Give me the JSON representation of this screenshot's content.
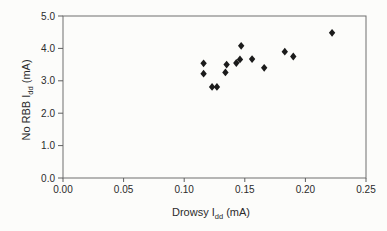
{
  "chart_data": {
    "type": "scatter",
    "title": "",
    "xlabel": {
      "pre": "Drowsy I",
      "sub": "dd",
      "post": " (mA)"
    },
    "ylabel": {
      "pre": "No RBB I",
      "sub": "dd",
      "post": " (mA)"
    },
    "xlim": [
      0,
      0.25
    ],
    "ylim": [
      0,
      5
    ],
    "x_ticks": [
      "0.00",
      "0.05",
      "0.10",
      "0.15",
      "0.20",
      "0.25"
    ],
    "y_ticks": [
      "0.0",
      "1.0",
      "2.0",
      "3.0",
      "4.0",
      "5.0"
    ],
    "grid": false,
    "legend": "none",
    "marker": "diamond",
    "colors": {
      "marker": "#1b1b1b",
      "axis": "#6e6e6e",
      "text": "#2b2b2b",
      "background": "#fcfcfa"
    },
    "points": [
      {
        "x": 0.116,
        "y": 3.54
      },
      {
        "x": 0.116,
        "y": 3.22
      },
      {
        "x": 0.123,
        "y": 2.81
      },
      {
        "x": 0.127,
        "y": 2.81
      },
      {
        "x": 0.134,
        "y": 3.26
      },
      {
        "x": 0.135,
        "y": 3.5
      },
      {
        "x": 0.143,
        "y": 3.55
      },
      {
        "x": 0.146,
        "y": 3.66
      },
      {
        "x": 0.147,
        "y": 4.08
      },
      {
        "x": 0.156,
        "y": 3.67
      },
      {
        "x": 0.166,
        "y": 3.4
      },
      {
        "x": 0.183,
        "y": 3.9
      },
      {
        "x": 0.19,
        "y": 3.75
      },
      {
        "x": 0.222,
        "y": 4.48
      }
    ]
  }
}
